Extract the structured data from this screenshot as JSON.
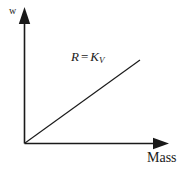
{
  "figure": {
    "background_color": "#ffffff",
    "stroke_color": "#1a1a1a",
    "y_axis_label": "w",
    "x_axis_label": "Mass",
    "equation": {
      "lhs": "R",
      "operator": "=",
      "rhs_base": "K",
      "rhs_subscript": "V",
      "full": "R = KV"
    }
  },
  "chart_data": {
    "type": "line",
    "title": "",
    "subtitle": "",
    "xlabel": "Mass",
    "ylabel": "w",
    "grid": false,
    "legend": null,
    "axis_style": "arrow-terminated half-axes through origin",
    "xlim": [
      0,
      1
    ],
    "ylim": [
      0,
      1
    ],
    "x_ticks": [],
    "y_ticks": [],
    "x_tick_labels": [],
    "y_tick_labels": [],
    "series": [
      {
        "name": "R = KV",
        "kind": "straight-line-through-origin",
        "x": [
          0,
          1
        ],
        "values": [
          0,
          1
        ],
        "slope": 1,
        "intercept": 0,
        "color": "#1a1a1a"
      }
    ],
    "annotations": [
      {
        "text": "R = KV",
        "x": 0.42,
        "y": 0.73,
        "italic": true
      }
    ]
  }
}
